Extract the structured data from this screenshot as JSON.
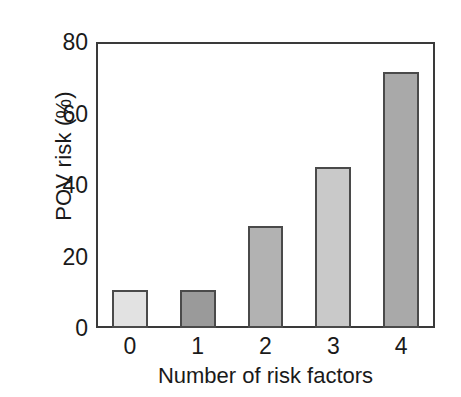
{
  "chart_data": {
    "type": "bar",
    "title": "",
    "subtitle": "",
    "xlabel": "Number of risk factors",
    "ylabel": "POV risk (%)",
    "categories": [
      "0",
      "1",
      "2",
      "3",
      "4"
    ],
    "values": [
      10.5,
      10.7,
      28.5,
      45,
      71.5
    ],
    "series": [
      {
        "name": "POV risk",
        "values": [
          10.5,
          10.7,
          28.5,
          45,
          71.5
        ]
      }
    ],
    "xlim": [
      -0.5,
      4.5
    ],
    "ylim": [
      0,
      80
    ],
    "yticks": [
      0,
      20,
      40,
      60,
      80
    ],
    "ytick_labels": [
      "0",
      "20",
      "40",
      "60",
      "80"
    ],
    "xticks": [
      0,
      1,
      2,
      3,
      4
    ],
    "xtick_labels": [
      "0",
      "1",
      "2",
      "3",
      "4"
    ],
    "grid": false,
    "legend": null,
    "legend_position": "none",
    "bar_colors": [
      "#e2e2e2",
      "#9a9a9a",
      "#b2b2b2",
      "#c9c9c9",
      "#a9a9a9"
    ],
    "bar_edge_color": "#4a4a4a",
    "axis_color": "#3a3a3a",
    "background_color": "#ffffff",
    "text_color": "#1a1a1a",
    "annotations": []
  }
}
